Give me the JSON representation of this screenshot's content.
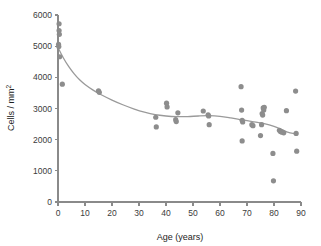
{
  "chart_data": {
    "type": "scatter",
    "title": "",
    "xlabel": "Age (years)",
    "ylabel": "Cells / mm²",
    "xlim": [
      0,
      90
    ],
    "ylim": [
      0,
      6000
    ],
    "xticks": [
      0,
      10,
      20,
      30,
      40,
      50,
      60,
      70,
      80,
      90
    ],
    "yticks": [
      0,
      1000,
      2000,
      3000,
      4000,
      5000,
      6000
    ],
    "xtick_labels": [
      "0",
      "10",
      "20",
      "30",
      "40",
      "50",
      "60",
      "70",
      "80",
      "90"
    ],
    "ytick_labels": [
      "0",
      "1000",
      "2000",
      "3000",
      "4000",
      "5000",
      "6000"
    ],
    "grid": false,
    "legend": null,
    "point_color": "#8d8d8d",
    "curve_color": "#9a9a9a",
    "axis_color": "#8a8a8a",
    "series": [
      {
        "name": "Corneal endothelial cell density",
        "marker": "circle",
        "points": [
          [
            0.4,
            5720
          ],
          [
            0.4,
            5500
          ],
          [
            0.5,
            5380
          ],
          [
            0.2,
            5060
          ],
          [
            0.3,
            4990
          ],
          [
            0.6,
            4660
          ],
          [
            1.6,
            3780
          ],
          [
            15.0,
            3570
          ],
          [
            15.3,
            3520
          ],
          [
            36.2,
            2720
          ],
          [
            36.4,
            2410
          ],
          [
            40.2,
            3170
          ],
          [
            40.4,
            3050
          ],
          [
            43.6,
            2640
          ],
          [
            43.8,
            2580
          ],
          [
            44.4,
            2860
          ],
          [
            53.8,
            2920
          ],
          [
            55.6,
            2800
          ],
          [
            55.8,
            2760
          ],
          [
            56.0,
            2480
          ],
          [
            67.8,
            3700
          ],
          [
            68.0,
            2950
          ],
          [
            68.2,
            2620
          ],
          [
            68.4,
            2570
          ],
          [
            68.2,
            1960
          ],
          [
            71.8,
            2480
          ],
          [
            72.2,
            2450
          ],
          [
            75.4,
            2480
          ],
          [
            75.6,
            2840
          ],
          [
            75.8,
            2790
          ],
          [
            76.0,
            3020
          ],
          [
            76.2,
            2950
          ],
          [
            76.4,
            3040
          ],
          [
            75.0,
            2130
          ],
          [
            79.6,
            1560
          ],
          [
            79.8,
            680
          ],
          [
            82.0,
            2300
          ],
          [
            82.4,
            2260
          ],
          [
            83.0,
            2240
          ],
          [
            83.6,
            2220
          ],
          [
            84.6,
            2930
          ],
          [
            88.0,
            3560
          ],
          [
            88.2,
            2200
          ],
          [
            88.4,
            1630
          ]
        ]
      }
    ],
    "trend_curve": {
      "name": "fitted smooth curve",
      "points": [
        [
          0.0,
          4960
        ],
        [
          2.0,
          4620
        ],
        [
          4.0,
          4340
        ],
        [
          6.0,
          4110
        ],
        [
          8.0,
          3920
        ],
        [
          10.0,
          3770
        ],
        [
          13.0,
          3590
        ],
        [
          16.0,
          3440
        ],
        [
          20.0,
          3270
        ],
        [
          24.0,
          3120
        ],
        [
          28.0,
          2990
        ],
        [
          32.0,
          2880
        ],
        [
          36.0,
          2800
        ],
        [
          40.0,
          2760
        ],
        [
          44.0,
          2740
        ],
        [
          48.0,
          2740
        ],
        [
          52.0,
          2760
        ],
        [
          56.0,
          2770
        ],
        [
          60.0,
          2750
        ],
        [
          64.0,
          2700
        ],
        [
          68.0,
          2640
        ],
        [
          72.0,
          2580
        ],
        [
          76.0,
          2520
        ],
        [
          80.0,
          2430
        ],
        [
          83.0,
          2320
        ],
        [
          85.0,
          2240
        ],
        [
          87.0,
          2200
        ],
        [
          88.5,
          2200
        ]
      ]
    }
  },
  "plot_geometry": {
    "origin_x": 58,
    "origin_y": 202,
    "plot_width": 243,
    "plot_height": 187,
    "point_radius": 2.6
  }
}
